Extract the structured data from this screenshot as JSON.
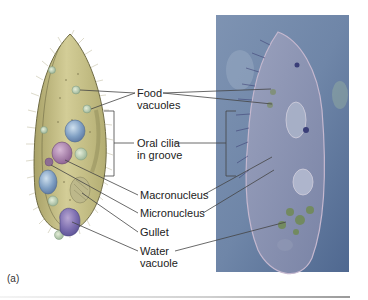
{
  "figure": {
    "panel_label": "(a)",
    "labels": {
      "food_vacuoles": [
        "Food",
        "vacuoles"
      ],
      "oral_cilia": [
        "Oral cilia",
        "in groove"
      ],
      "macronucleus": "Macronucleus",
      "micronucleus": "Micronucleus",
      "gullet": "Gullet",
      "water_vacuole": [
        "Water",
        "vacuole"
      ]
    },
    "left_panel": "Illustration of paramecium",
    "right_panel": "Light micrograph of paramecium",
    "colors": {
      "cell_body": "#c9c38a",
      "micrograph_bg": "#6f86a8",
      "leader_lines": "#444444"
    }
  }
}
